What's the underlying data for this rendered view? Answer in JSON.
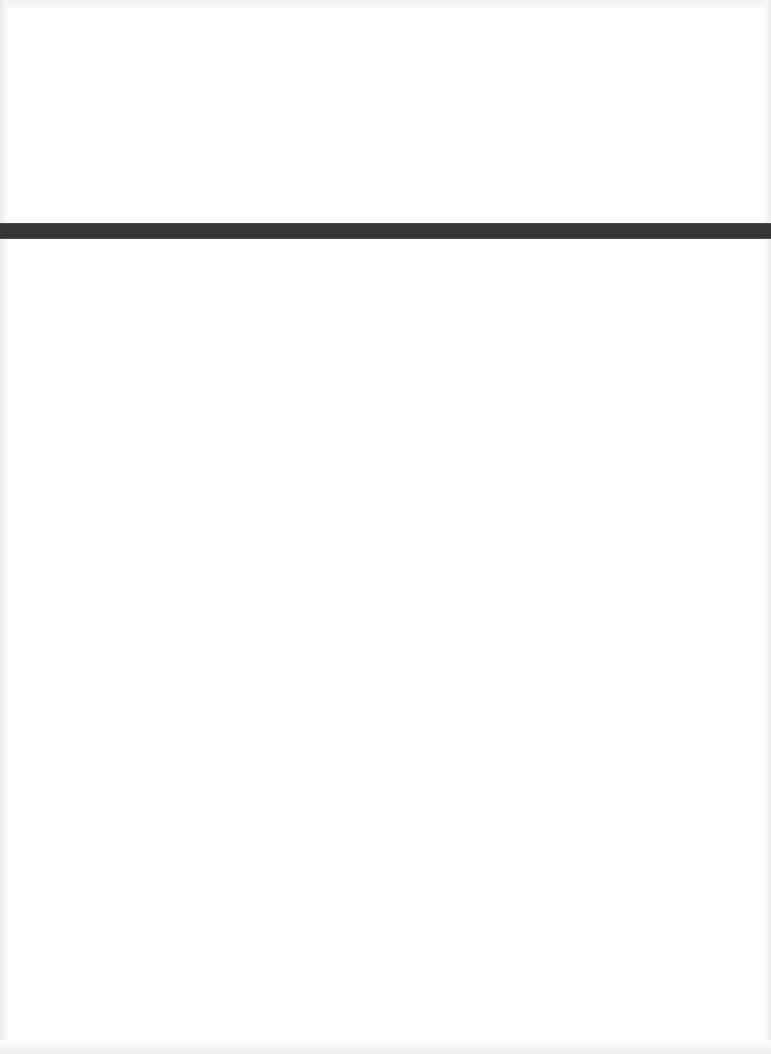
{
  "document": {
    "background_color": "#fdfdfd",
    "rule": {
      "color": "#353535",
      "top_px": 223,
      "height_px": 16,
      "full_width": true
    },
    "text_content": []
  }
}
